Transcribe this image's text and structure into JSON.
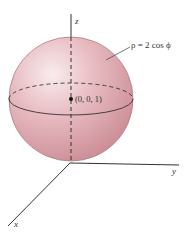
{
  "figure": {
    "equation_label": "ρ = 2 cos ϕ",
    "point_label": "(0, 0, 1)",
    "axes": {
      "x": "x",
      "y": "y",
      "z": "z"
    },
    "colors": {
      "sphere_fill": "#e6b5bb",
      "sphere_highlight": "#f7e6e8",
      "sphere_shade": "#cf8f98",
      "sphere_edge": "#b07a82",
      "axis": "#333333"
    }
  }
}
